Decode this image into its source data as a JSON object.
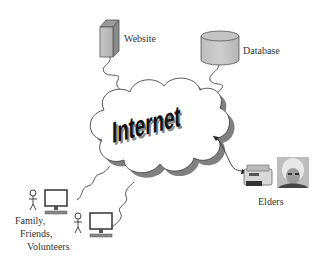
{
  "diagram": {
    "center": {
      "label": "Internet",
      "shape": "cloud"
    },
    "nodes": [
      {
        "id": "website",
        "label": "Website",
        "icon": "server-tower-icon"
      },
      {
        "id": "database",
        "label": "Database",
        "icon": "database-cylinder-icon"
      },
      {
        "id": "elders",
        "label": "Elders",
        "icon": "printer-icon",
        "extra": "elder-photo"
      },
      {
        "id": "family",
        "label_lines": [
          "Family,",
          "Friends,",
          "Volunteers"
        ],
        "icon": "computer-icon"
      }
    ],
    "edges": [
      {
        "from": "website",
        "to": "internet",
        "style": "squiggle"
      },
      {
        "from": "database",
        "to": "internet",
        "style": "squiggle"
      },
      {
        "from": "internet",
        "to": "elders",
        "style": "bidirectional-arrow"
      },
      {
        "from": "family",
        "to": "internet",
        "style": "squiggle",
        "count": 2
      }
    ]
  },
  "labels": {
    "website": "Website",
    "database": "Database",
    "elders": "Elders",
    "family_1": "Family,",
    "family_2": "Friends,",
    "family_3": "Volunteers",
    "internet": "Internet"
  }
}
